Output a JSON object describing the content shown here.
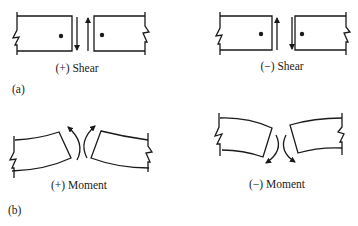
{
  "figure": {
    "part_a": {
      "tag": "(a)",
      "positive": {
        "label": "(+) Shear"
      },
      "negative": {
        "label": "(−) Shear"
      }
    },
    "part_b": {
      "tag": "(b)",
      "positive": {
        "label": "(+) Moment"
      },
      "negative": {
        "label": "(−) Moment"
      }
    }
  },
  "colors": {
    "ink": "#1a1a1a",
    "background": "#ffffff"
  }
}
